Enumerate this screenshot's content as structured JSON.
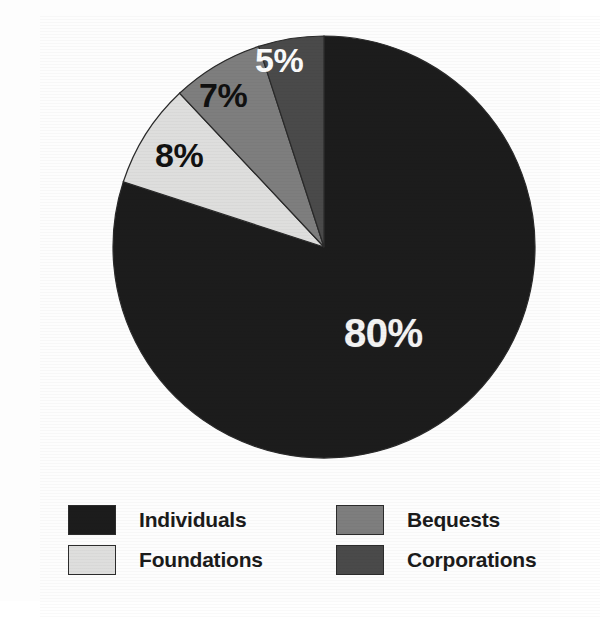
{
  "chart_data": {
    "type": "pie",
    "title": "",
    "subtitle": "",
    "xlabel": "",
    "ylabel": "",
    "legend_position": "bottom",
    "grid": false,
    "start_angle_deg": 90,
    "direction": "counterclockwise",
    "categories": [
      "Individuals",
      "Foundations",
      "Bequests",
      "Corporations"
    ],
    "values": [
      80,
      8,
      7,
      5
    ],
    "value_labels": [
      "80%",
      "8%",
      "7%",
      "5%"
    ],
    "colors": [
      "#1c1c1c",
      "#dededd",
      "#7e7e7e",
      "#4a4a4a"
    ],
    "label_text_colors": [
      "#f3f3f3",
      "#111111",
      "#101010",
      "#fbfbfb"
    ],
    "slices": [
      {
        "label": "Individuals",
        "value": 80,
        "value_label": "80%",
        "color": "#1c1c1c",
        "label_color": "#f3f3f3"
      },
      {
        "label": "Foundations",
        "value": 8,
        "value_label": "8%",
        "color": "#dededd",
        "label_color": "#111111"
      },
      {
        "label": "Bequests",
        "value": 7,
        "value_label": "7%",
        "color": "#7e7e7e",
        "label_color": "#101010"
      },
      {
        "label": "Corporations",
        "value": 5,
        "value_label": "5%",
        "color": "#4a4a4a",
        "label_color": "#fbfbfb"
      }
    ]
  },
  "legend": {
    "items": [
      {
        "label": "Individuals",
        "color": "#1c1c1c"
      },
      {
        "label": "Bequests",
        "color": "#7e7e7e"
      },
      {
        "label": "Foundations",
        "color": "#dededd"
      },
      {
        "label": "Corporations",
        "color": "#4a4a4a"
      }
    ]
  }
}
